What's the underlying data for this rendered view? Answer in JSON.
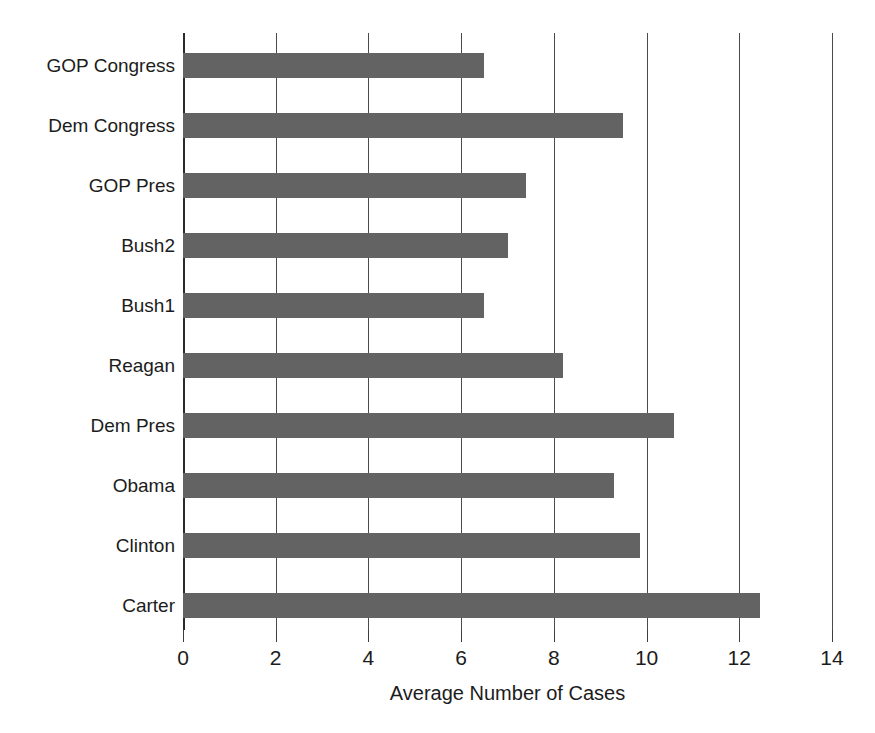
{
  "chart_data": {
    "type": "bar",
    "orientation": "horizontal",
    "title": "",
    "xlabel": "Average Number of Cases",
    "ylabel": "",
    "xlim": [
      0,
      14
    ],
    "ylim": null,
    "grid": true,
    "grid_axis": "x",
    "legend": null,
    "xticks": [
      0,
      2,
      4,
      6,
      8,
      10,
      12,
      14
    ],
    "xtick_labels": [
      "0",
      "2",
      "4",
      "6",
      "8",
      "10",
      "12",
      "14"
    ],
    "categories": [
      "GOP Congress",
      "Dem Congress",
      "GOP Pres",
      "Bush2",
      "Bush1",
      "Reagan",
      "Dem Pres",
      "Obama",
      "Clinton",
      "Carter"
    ],
    "values": [
      6.5,
      9.5,
      7.4,
      7.0,
      6.5,
      8.2,
      10.6,
      9.3,
      9.85,
      12.45
    ],
    "bar_color": "#636363",
    "background_color": "#ffffff",
    "axis_color": "#3d3d3d"
  },
  "axis": {
    "x_title": "Average Number of Cases"
  }
}
